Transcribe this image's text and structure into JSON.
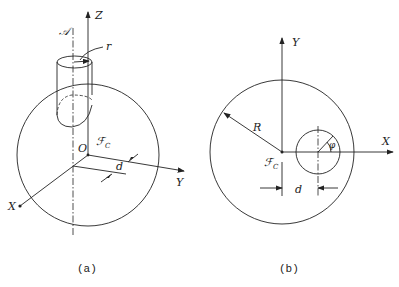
{
  "figure_a": {
    "caption": "(a)",
    "labels": {
      "z_axis": "Z",
      "y_axis": "Y",
      "x_axis": "X",
      "origin": "O",
      "axis_a": "𝒜",
      "radius_small": "r",
      "frame": "ℱ",
      "frame_sub": "C",
      "offset": "d"
    }
  },
  "figure_b": {
    "caption": "(b)",
    "labels": {
      "y_axis": "Y",
      "x_axis": "X",
      "radius_big": "R",
      "angle": "φ",
      "frame": "ℱ",
      "frame_sub": "C",
      "offset": "d"
    }
  }
}
